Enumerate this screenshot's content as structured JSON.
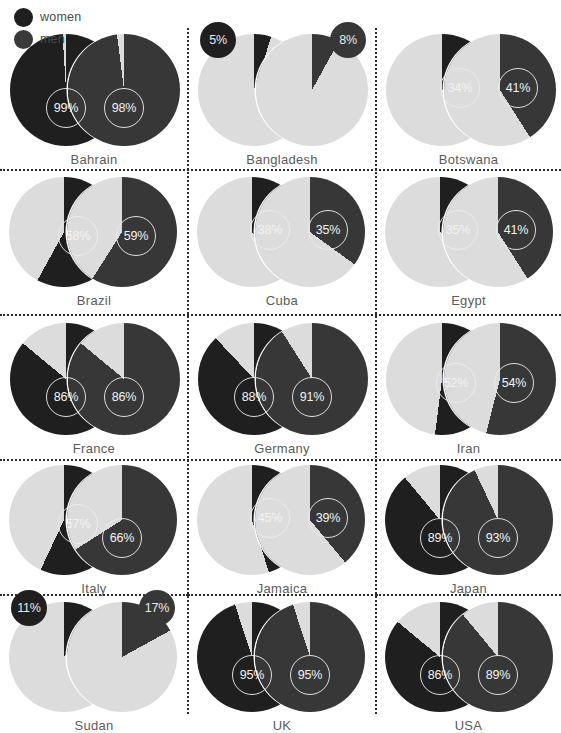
{
  "legend": {
    "items": [
      {
        "label": "women",
        "color": "#1f1f1f",
        "icon": "circle-swatch-women"
      },
      {
        "label": "men",
        "color": "#3a3a3a",
        "icon": "circle-swatch-men"
      }
    ]
  },
  "colors": {
    "women_dark": "#1f1f1f",
    "men_dark": "#373737",
    "remainder_light": "#dcdcdc",
    "label_text": "#f0f0f0",
    "country_text": "#5b5b5b",
    "divider": "#2a2a2a",
    "background": "#ffffff"
  },
  "chart_data": {
    "type": "pie",
    "title": "",
    "series_names": [
      "women",
      "men"
    ],
    "legend_position": "top-left",
    "grid": "5 rows x 3 columns of paired pie charts",
    "value_unit": "%",
    "note": "each country shows two pies: left = women, right = men; dark slice = value, light gray = remainder",
    "countries": [
      {
        "name": "Bahrain",
        "women": 99,
        "men": 98,
        "women_label": "99%",
        "men_label": "98%",
        "women_label_pos": "inside",
        "men_label_pos": "inside"
      },
      {
        "name": "Bangladesh",
        "women": 5,
        "men": 8,
        "women_label": "5%",
        "men_label": "8%",
        "women_label_pos": "badge-left",
        "men_label_pos": "badge-right"
      },
      {
        "name": "Botswana",
        "women": 34,
        "men": 41,
        "women_label": "34%",
        "men_label": "41%",
        "women_label_pos": "inside",
        "men_label_pos": "inside"
      },
      {
        "name": "Brazil",
        "women": 58,
        "men": 59,
        "women_label": "58%",
        "men_label": "59%",
        "women_label_pos": "inside",
        "men_label_pos": "inside"
      },
      {
        "name": "Cuba",
        "women": 38,
        "men": 35,
        "women_label": "38%",
        "men_label": "35%",
        "women_label_pos": "inside",
        "men_label_pos": "inside"
      },
      {
        "name": "Egypt",
        "women": 35,
        "men": 41,
        "women_label": "35%",
        "men_label": "41%",
        "women_label_pos": "inside",
        "men_label_pos": "inside"
      },
      {
        "name": "France",
        "women": 86,
        "men": 86,
        "women_label": "86%",
        "men_label": "86%",
        "women_label_pos": "inside",
        "men_label_pos": "inside"
      },
      {
        "name": "Germany",
        "women": 88,
        "men": 91,
        "women_label": "88%",
        "men_label": "91%",
        "women_label_pos": "inside",
        "men_label_pos": "inside"
      },
      {
        "name": "Iran",
        "women": 52,
        "men": 54,
        "women_label": "52%",
        "men_label": "54%",
        "women_label_pos": "inside",
        "men_label_pos": "inside"
      },
      {
        "name": "Italy",
        "women": 57,
        "men": 66,
        "women_label": "57%",
        "men_label": "66%",
        "women_label_pos": "inside",
        "men_label_pos": "inside"
      },
      {
        "name": "Jamaica",
        "women": 45,
        "men": 39,
        "women_label": "45%",
        "men_label": "39%",
        "women_label_pos": "inside",
        "men_label_pos": "inside"
      },
      {
        "name": "Japan",
        "women": 89,
        "men": 93,
        "women_label": "89%",
        "men_label": "93%",
        "women_label_pos": "inside",
        "men_label_pos": "inside"
      },
      {
        "name": "Sudan",
        "women": 11,
        "men": 17,
        "women_label": "11%",
        "men_label": "17%",
        "women_label_pos": "badge-left",
        "men_label_pos": "badge-right"
      },
      {
        "name": "UK",
        "women": 95,
        "men": 95,
        "women_label": "95%",
        "men_label": "95%",
        "women_label_pos": "inside",
        "men_label_pos": "inside"
      },
      {
        "name": "USA",
        "women": 86,
        "men": 89,
        "women_label": "86%",
        "men_label": "89%",
        "women_label_pos": "inside",
        "men_label_pos": "inside"
      }
    ]
  }
}
